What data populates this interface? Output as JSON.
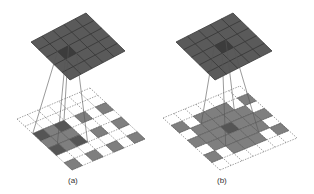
{
  "figure": {
    "panels": [
      {
        "id": "a",
        "caption": "(a)",
        "caption_pos": [
          68,
          176
        ],
        "top_grid": {
          "size": 5,
          "corners": {
            "left": [
              31,
              42
            ],
            "top": [
              86,
              13
            ],
            "right": [
              126,
              50
            ],
            "bottom": [
              70,
              80
            ]
          },
          "highlight_cells": [
            [
              1,
              2
            ]
          ]
        },
        "bottom_grid": {
          "size": 7,
          "corners": {
            "left": [
              17,
              119
            ],
            "top": [
              90,
              88
            ],
            "right": [
              147,
              133
            ],
            "bottom": [
              72,
              170
            ]
          },
          "filled_cells": [
            [
              0,
              2
            ],
            [
              1,
              2
            ],
            [
              2,
              2
            ],
            [
              0,
              3
            ],
            [
              1,
              3
            ],
            [
              2,
              3
            ],
            [
              0,
              4
            ],
            [
              1,
              4
            ],
            [
              2,
              4
            ],
            [
              0,
              6
            ],
            [
              2,
              6
            ],
            [
              4,
              6
            ],
            [
              4,
              2
            ],
            [
              4,
              4
            ],
            [
              6,
              2
            ],
            [
              6,
              4
            ],
            [
              6,
              6
            ]
          ],
          "dark_cells": [
            [
              0,
              2
            ],
            [
              2,
              2
            ],
            [
              0,
              4
            ],
            [
              2,
              4
            ]
          ],
          "receptive_field": [
            [
              0,
              2
            ],
            [
              2,
              4
            ]
          ]
        },
        "projection_lines_from_cell": [
          1,
          2
        ]
      },
      {
        "id": "b",
        "caption": "(b)",
        "caption_pos": [
          217,
          176
        ],
        "top_grid": {
          "size": 5,
          "corners": {
            "left": [
              176,
              42
            ],
            "top": [
              233,
              13
            ],
            "right": [
              275,
              50
            ],
            "bottom": [
              215,
              80
            ]
          },
          "highlight_cells": [
            [
              2,
              2
            ]
          ]
        },
        "bottom_grid": {
          "size": 7,
          "corners": {
            "left": [
              163,
              118
            ],
            "top": [
              240,
              86
            ],
            "right": [
              297,
              132
            ],
            "bottom": [
              220,
              170
            ]
          },
          "filled_cells": [
            [
              0,
              1
            ],
            [
              0,
              3
            ],
            [
              0,
              5
            ],
            [
              1,
              2
            ],
            [
              1,
              3
            ],
            [
              1,
              4
            ],
            [
              2,
              1
            ],
            [
              2,
              2
            ],
            [
              2,
              3
            ],
            [
              2,
              4
            ],
            [
              2,
              5
            ],
            [
              3,
              1
            ],
            [
              3,
              2
            ],
            [
              3,
              3
            ],
            [
              3,
              4
            ],
            [
              3,
              5
            ],
            [
              4,
              1
            ],
            [
              4,
              2
            ],
            [
              4,
              3
            ],
            [
              4,
              4
            ],
            [
              4,
              5
            ],
            [
              5,
              2
            ],
            [
              5,
              3
            ],
            [
              5,
              4
            ],
            [
              6,
              1
            ],
            [
              6,
              3
            ],
            [
              6,
              5
            ]
          ],
          "dark_cells": [
            [
              3,
              3
            ]
          ],
          "receptive_field": [
            [
              2,
              2
            ],
            [
              4,
              4
            ]
          ]
        },
        "projection_lines_from_cell": [
          2,
          2
        ]
      }
    ],
    "colors": {
      "top_grid_fill": "#5a5a5a",
      "top_grid_line": "#3a3a3a",
      "top_grid_highlight": "#3c3c3c",
      "bottom_cell_fill": "#7f7f7f",
      "bottom_cell_dark": "#555555",
      "dashed_line": "#666666",
      "projection_line": "#555555"
    }
  }
}
